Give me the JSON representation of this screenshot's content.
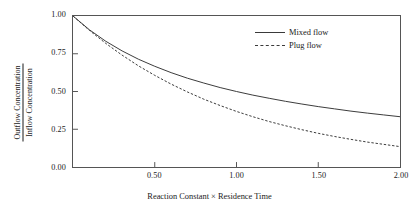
{
  "chart_data": {
    "type": "line",
    "title": "",
    "xlabel": "Reaction Constant × Residence Time",
    "ylabel_numerator": "Outflow Concentration",
    "ylabel_denominator": "Inflow Concentration",
    "xlim": [
      0,
      2.0
    ],
    "ylim": [
      0,
      1.0
    ],
    "grid": false,
    "legend_position": "upper right inside plot area",
    "xticks": [
      0.5,
      1.0,
      1.5,
      2.0
    ],
    "xtick_labels": [
      "0.50",
      "1.00",
      "1.50",
      "2.00"
    ],
    "yticks": [
      0.0,
      0.25,
      0.5,
      0.75,
      1.0
    ],
    "ytick_labels": [
      "0.00",
      "0.25",
      "0.50",
      "0.75",
      "1.00"
    ],
    "x": [
      0.0,
      0.1,
      0.2,
      0.3,
      0.4,
      0.5,
      0.6,
      0.7,
      0.8,
      0.9,
      1.0,
      1.1,
      1.2,
      1.3,
      1.4,
      1.5,
      1.6,
      1.7,
      1.8,
      1.9,
      2.0
    ],
    "series": [
      {
        "name": "Mixed flow",
        "style": "solid",
        "color": "#3a3a3a",
        "values": [
          1.0,
          0.909,
          0.833,
          0.769,
          0.714,
          0.667,
          0.625,
          0.588,
          0.556,
          0.526,
          0.5,
          0.476,
          0.455,
          0.435,
          0.417,
          0.4,
          0.385,
          0.37,
          0.357,
          0.345,
          0.333
        ]
      },
      {
        "name": "Plug flow",
        "style": "dashed",
        "color": "#3a3a3a",
        "values": [
          1.0,
          0.905,
          0.819,
          0.741,
          0.67,
          0.607,
          0.549,
          0.497,
          0.449,
          0.407,
          0.368,
          0.333,
          0.301,
          0.273,
          0.247,
          0.223,
          0.202,
          0.183,
          0.165,
          0.15,
          0.135
        ]
      }
    ]
  },
  "legend": {
    "items": [
      {
        "label": "Mixed flow",
        "style": "solid"
      },
      {
        "label": "Plug flow",
        "style": "dashed"
      }
    ]
  }
}
